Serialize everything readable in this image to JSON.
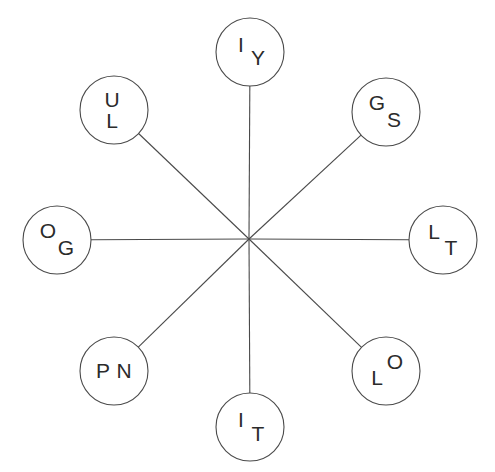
{
  "canvas": {
    "width": 495,
    "height": 472,
    "background_color": "#ffffff",
    "stroke_color": "#4a4a4a",
    "text_color": "#2b2b2b"
  },
  "hub": {
    "label": "center-hub",
    "x": 249,
    "y": 239
  },
  "nodes": [
    {
      "name": "node-iy",
      "position": "top",
      "cx": 250,
      "cy": 52,
      "r": 34,
      "letters": [
        {
          "char": "I",
          "dx": -9,
          "dy": -6
        },
        {
          "char": "Y",
          "dx": 8,
          "dy": 7
        }
      ]
    },
    {
      "name": "node-gs",
      "position": "top-right",
      "cx": 386,
      "cy": 112,
      "r": 34,
      "letters": [
        {
          "char": "G",
          "dx": -9,
          "dy": -8
        },
        {
          "char": "S",
          "dx": 8,
          "dy": 9
        }
      ]
    },
    {
      "name": "node-lt",
      "position": "right",
      "cx": 443,
      "cy": 240,
      "r": 34,
      "letters": [
        {
          "char": "L",
          "dx": -9,
          "dy": -7
        },
        {
          "char": "T",
          "dx": 8,
          "dy": 9
        }
      ]
    },
    {
      "name": "node-lo",
      "position": "bottom-right",
      "cx": 386,
      "cy": 371,
      "r": 34,
      "letters": [
        {
          "char": "L",
          "dx": -9,
          "dy": 8
        },
        {
          "char": "O",
          "dx": 9,
          "dy": -8
        }
      ]
    },
    {
      "name": "node-it",
      "position": "bottom",
      "cx": 250,
      "cy": 427,
      "r": 34,
      "letters": [
        {
          "char": "I",
          "dx": -9,
          "dy": -6
        },
        {
          "char": "T",
          "dx": 8,
          "dy": 8
        }
      ]
    },
    {
      "name": "node-pn",
      "position": "bottom-left",
      "cx": 114,
      "cy": 371,
      "r": 34,
      "letters": [
        {
          "char": "P",
          "dx": -11,
          "dy": 1
        },
        {
          "char": "N",
          "dx": 10,
          "dy": 1
        }
      ]
    },
    {
      "name": "node-og",
      "position": "left",
      "cx": 57,
      "cy": 240,
      "r": 34,
      "letters": [
        {
          "char": "O",
          "dx": -9,
          "dy": -8
        },
        {
          "char": "G",
          "dx": 9,
          "dy": 9
        }
      ]
    },
    {
      "name": "node-ul",
      "position": "top-left",
      "cx": 114,
      "cy": 110,
      "r": 34,
      "letters": [
        {
          "char": "U",
          "dx": -2,
          "dy": -9
        },
        {
          "char": "L",
          "dx": -2,
          "dy": 12
        }
      ]
    }
  ],
  "chart_data": {
    "type": "diagram",
    "subtype": "radial-spoke",
    "title": "",
    "hub_count": 1,
    "node_count": 8,
    "nodes_labels": [
      "IY",
      "GS",
      "LT",
      "LO",
      "IT",
      "PN",
      "OG",
      "UL"
    ],
    "edges": [
      {
        "from": "center-hub",
        "to": "node-iy"
      },
      {
        "from": "center-hub",
        "to": "node-gs"
      },
      {
        "from": "center-hub",
        "to": "node-lt"
      },
      {
        "from": "center-hub",
        "to": "node-lo"
      },
      {
        "from": "center-hub",
        "to": "node-it"
      },
      {
        "from": "center-hub",
        "to": "node-pn"
      },
      {
        "from": "center-hub",
        "to": "node-og"
      },
      {
        "from": "center-hub",
        "to": "node-ul"
      }
    ]
  }
}
